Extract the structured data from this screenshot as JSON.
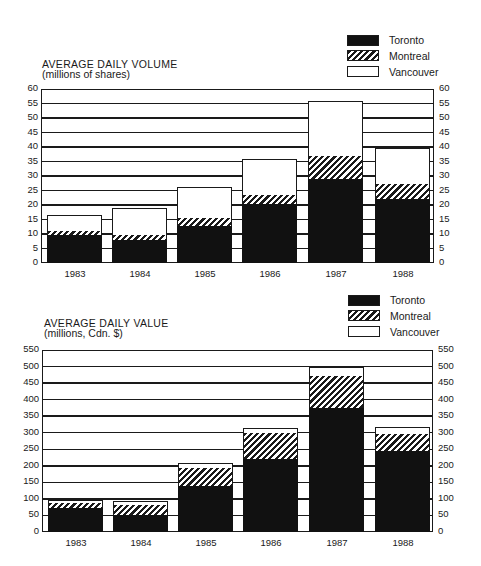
{
  "chart_data": [
    {
      "type": "bar",
      "stacked": true,
      "title": "AVERAGE DAILY VOLUME",
      "subtitle": "(millions of shares)",
      "xlabel": "",
      "ylabel": "millions of shares",
      "categories": [
        "1983",
        "1984",
        "1985",
        "1986",
        "1987",
        "1988"
      ],
      "series": [
        {
          "name": "Toronto",
          "values": [
            9.7,
            7.8,
            12.9,
            20.2,
            28.9,
            21.9
          ]
        },
        {
          "name": "Montreal",
          "values": [
            1.4,
            1.8,
            2.5,
            3.2,
            7.9,
            5.2
          ]
        },
        {
          "name": "Vancouver",
          "values": [
            5.3,
            9.3,
            10.7,
            12.3,
            19.1,
            12.5
          ]
        }
      ],
      "totals": [
        16.4,
        18.9,
        26.1,
        35.7,
        55.9,
        39.6
      ],
      "ylim": [
        0,
        60
      ],
      "yticks": [
        "60",
        "55",
        "50",
        "45",
        "40",
        "35",
        "30",
        "25",
        "20",
        "15",
        "10",
        "5",
        "0"
      ],
      "grid": true,
      "dual_y_axis": true,
      "legend": [
        "Toronto",
        "Montreal",
        "Vancouver"
      ],
      "legend_position": "top-right"
    },
    {
      "type": "bar",
      "stacked": true,
      "title": "AVERAGE DAILY VALUE",
      "subtitle": "(millions, Cdn. $)",
      "xlabel": "",
      "ylabel": "millions, Cdn. $",
      "categories": [
        "1983",
        "1984",
        "1985",
        "1986",
        "1987",
        "1988"
      ],
      "series": [
        {
          "name": "Toronto",
          "values": [
            72,
            51,
            139,
            222,
            376,
            245
          ]
        },
        {
          "name": "Montreal",
          "values": [
            17,
            30,
            55,
            77,
            94,
            52
          ]
        },
        {
          "name": "Vancouver",
          "values": [
            9,
            12,
            14,
            16,
            30,
            19
          ]
        }
      ],
      "totals": [
        98,
        93,
        208,
        315,
        500,
        316
      ],
      "ylim": [
        0,
        550
      ],
      "yticks": [
        "550",
        "500",
        "450",
        "400",
        "350",
        "300",
        "250",
        "200",
        "150",
        "100",
        "50",
        "0"
      ],
      "grid": true,
      "dual_y_axis": true,
      "legend": [
        "Toronto",
        "Montreal",
        "Vancouver"
      ],
      "legend_position": "top-right"
    }
  ],
  "charts": [
    {
      "title": "AVERAGE DAILY VOLUME",
      "subtitle": "(millions of shares)",
      "legend": {
        "toronto": "Toronto",
        "montreal": "Montreal",
        "vancouver": "Vancouver"
      },
      "years": [
        "1983",
        "1984",
        "1985",
        "1986",
        "1987",
        "1988"
      ]
    },
    {
      "title": "AVERAGE DAILY VALUE",
      "subtitle": "(millions, Cdn. $)",
      "legend": {
        "toronto": "Toronto",
        "montreal": "Montreal",
        "vancouver": "Vancouver"
      },
      "years": [
        "1983",
        "1984",
        "1985",
        "1986",
        "1987",
        "1988"
      ]
    }
  ],
  "colors": {
    "toronto": "#111111",
    "montreal": "hatched",
    "vancouver": "#ffffff",
    "ink": "#1a1a1a"
  }
}
